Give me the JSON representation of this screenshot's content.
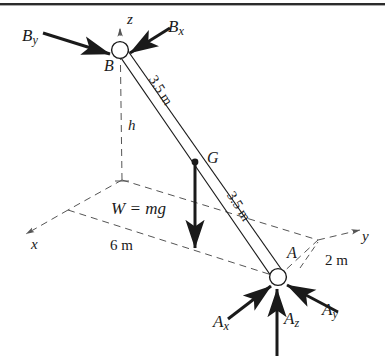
{
  "figure": {
    "type": "engineering-free-body-diagram",
    "colors": {
      "line": "#1a1a1a",
      "dashed": "#555555",
      "background": "#ffffff",
      "border_rule": "#2b2b2b"
    },
    "points": {
      "B": {
        "label": "B",
        "x": 120,
        "y": 50,
        "kind": "pin-joint-circle"
      },
      "A": {
        "label": "A",
        "x": 278,
        "y": 277,
        "kind": "pin-joint-circle"
      },
      "G": {
        "label": "G",
        "x": 195,
        "y": 162,
        "kind": "center-of-mass-dot"
      },
      "O": {
        "label": "",
        "x": 122,
        "y": 180,
        "kind": "origin"
      }
    },
    "axes": [
      {
        "name": "z-axis",
        "label": "z",
        "label_x": 127,
        "label_y": 12
      },
      {
        "name": "x-axis",
        "label": "x",
        "label_x": 31,
        "label_y": 237
      },
      {
        "name": "y-axis",
        "label": "y",
        "label_x": 362,
        "label_y": 229
      }
    ],
    "dimensions": [
      {
        "name": "height-h",
        "label": "h",
        "label_x": 128,
        "label_y": 118,
        "italic": true
      },
      {
        "name": "rod-length-upper",
        "label": "3.5 m",
        "rotation_deg": 58
      },
      {
        "name": "rod-length-lower",
        "label": "3.5 m",
        "rotation_deg": 58
      },
      {
        "name": "base-6m",
        "label": "6 m",
        "label_x": 110,
        "label_y": 238
      },
      {
        "name": "base-2m",
        "label": "2 m",
        "label_x": 325,
        "label_y": 253
      }
    ],
    "forces": [
      {
        "name": "By",
        "label": "B",
        "subscript": "y",
        "label_x": 22,
        "label_y": 27,
        "at": "B",
        "direction": "from upper-left"
      },
      {
        "name": "Bx",
        "label": "B",
        "subscript": "x",
        "label_x": 168,
        "label_y": 18,
        "at": "B",
        "direction": "from upper-right"
      },
      {
        "name": "W",
        "label": "W = mg",
        "label_x": 111,
        "label_y": 200,
        "at": "G",
        "direction": "downward"
      },
      {
        "name": "Ax",
        "label": "A",
        "subscript": "x",
        "label_x": 213,
        "label_y": 313,
        "at": "A",
        "direction": "from lower-left"
      },
      {
        "name": "Az",
        "label": "A",
        "subscript": "z",
        "label_x": 284,
        "label_y": 310,
        "at": "A",
        "direction": "upward"
      },
      {
        "name": "Ay",
        "label": "A",
        "subscript": "y",
        "label_x": 322,
        "label_y": 301,
        "at": "A",
        "direction": "from lower-right"
      }
    ]
  }
}
